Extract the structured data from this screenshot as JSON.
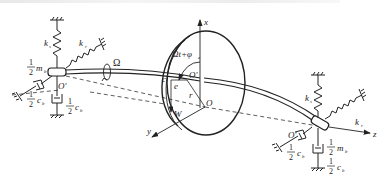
{
  "figure": {
    "type": "rotor-bearing system schematic (Jeffcott rotor with elastic supports)",
    "top_cropped_text": ""
  },
  "labels": {
    "ks_left": "k",
    "ks_left_sub": "s",
    "kr_left": "k",
    "kr_left_sub": "r",
    "mb_left_num": "1",
    "mb_left_den": "2",
    "mb_left_sym": "m",
    "mb_left_sub": "b",
    "O_prime_left": "O'",
    "cb_left_diag_num": "1",
    "cb_left_diag_den": "2",
    "cb_left_diag_sym": "c",
    "cb_left_diag_sub": "b",
    "cb_left_vert_num": "1",
    "cb_left_vert_den": "2",
    "cb_left_vert_sym": "c",
    "cb_left_vert_sub": "b",
    "omega": "Ω",
    "angle": "Ωt+φ",
    "angle_sub": "e",
    "x_axis": "x",
    "y_axis": "y",
    "z_axis": "z",
    "c": "c",
    "e": "e",
    "O_prime_disk": "O'",
    "r": "r",
    "O": "O",
    "W": "W",
    "ks_right": "k",
    "ks_right_sub": "s",
    "kr_right": "k",
    "kr_right_sub": "r",
    "O_prime_right": "O'",
    "mb_right_num": "1",
    "mb_right_den": "2",
    "mb_right_sym": "m",
    "mb_right_sub": "b",
    "cb_right_diag_num": "1",
    "cb_right_diag_den": "2",
    "cb_right_diag_sym": "c",
    "cb_right_diag_sub": "b",
    "cb_right_vert_num": "1",
    "cb_right_vert_den": "2",
    "cb_right_vert_sym": "c",
    "cb_right_vert_sub": "b"
  }
}
